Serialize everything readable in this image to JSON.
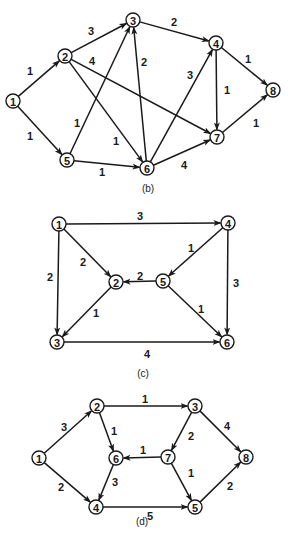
{
  "colors": {
    "ink": "#1a1a1a",
    "background": "#ffffff"
  },
  "node_radius": 7,
  "graphs": [
    {
      "id": "b",
      "caption": "(b)",
      "caption_pos": [
        148,
        188
      ],
      "nodes": [
        {
          "id": "1",
          "x": 13,
          "y": 101
        },
        {
          "id": "2",
          "x": 65,
          "y": 56
        },
        {
          "id": "3",
          "x": 133,
          "y": 20
        },
        {
          "id": "4",
          "x": 216,
          "y": 43
        },
        {
          "id": "5",
          "x": 67,
          "y": 160
        },
        {
          "id": "6",
          "x": 147,
          "y": 168
        },
        {
          "id": "7",
          "x": 217,
          "y": 137
        },
        {
          "id": "8",
          "x": 273,
          "y": 90
        }
      ],
      "edges": [
        {
          "from": "1",
          "to": "2",
          "weight": "1",
          "lx": 30,
          "ly": 71
        },
        {
          "from": "1",
          "to": "5",
          "weight": "1",
          "lx": 30,
          "ly": 136
        },
        {
          "from": "2",
          "to": "3",
          "weight": "3",
          "lx": 91,
          "ly": 31
        },
        {
          "from": "2",
          "to": "7",
          "weight": "4",
          "lx": 92,
          "ly": 61
        },
        {
          "from": "2",
          "to": "6",
          "weight": "1",
          "lx": 116,
          "ly": 141
        },
        {
          "from": "5",
          "to": "3",
          "weight": "1",
          "lx": 77,
          "ly": 123
        },
        {
          "from": "5",
          "to": "6",
          "weight": "1",
          "lx": 102,
          "ly": 172
        },
        {
          "from": "6",
          "to": "3",
          "weight": "2",
          "lx": 144,
          "ly": 62
        },
        {
          "from": "3",
          "to": "4",
          "weight": "2",
          "lx": 174,
          "ly": 22
        },
        {
          "from": "6",
          "to": "4",
          "weight": "3",
          "lx": 190,
          "ly": 75
        },
        {
          "from": "6",
          "to": "7",
          "weight": "4",
          "lx": 184,
          "ly": 165
        },
        {
          "from": "4",
          "to": "7",
          "weight": "1",
          "lx": 227,
          "ly": 90
        },
        {
          "from": "4",
          "to": "8",
          "weight": "1",
          "lx": 248,
          "ly": 59
        },
        {
          "from": "7",
          "to": "8",
          "weight": "1",
          "lx": 256,
          "ly": 123
        }
      ]
    },
    {
      "id": "c",
      "caption": "(c)",
      "caption_pos": [
        143,
        373
      ],
      "nodes": [
        {
          "id": "1",
          "x": 59,
          "y": 224
        },
        {
          "id": "2",
          "x": 116,
          "y": 282
        },
        {
          "id": "3",
          "x": 57,
          "y": 342
        },
        {
          "id": "4",
          "x": 228,
          "y": 223
        },
        {
          "id": "5",
          "x": 163,
          "y": 281
        },
        {
          "id": "6",
          "x": 227,
          "y": 342
        }
      ],
      "edges": [
        {
          "from": "1",
          "to": "4",
          "weight": "3",
          "lx": 140,
          "ly": 216
        },
        {
          "from": "1",
          "to": "2",
          "weight": "2",
          "lx": 83,
          "ly": 262
        },
        {
          "from": "1",
          "to": "3",
          "weight": "2",
          "lx": 50,
          "ly": 277
        },
        {
          "from": "4",
          "to": "5",
          "weight": "1",
          "lx": 191,
          "ly": 248
        },
        {
          "from": "5",
          "to": "2",
          "weight": "2",
          "lx": 140,
          "ly": 276
        },
        {
          "from": "4",
          "to": "6",
          "weight": "3",
          "lx": 236,
          "ly": 283
        },
        {
          "from": "2",
          "to": "3",
          "weight": "1",
          "lx": 96,
          "ly": 313
        },
        {
          "from": "5",
          "to": "6",
          "weight": "1",
          "lx": 201,
          "ly": 309
        },
        {
          "from": "3",
          "to": "6",
          "weight": "4",
          "lx": 147,
          "ly": 354
        }
      ]
    },
    {
      "id": "d",
      "caption": "(d)",
      "caption_pos": [
        142,
        521
      ],
      "nodes": [
        {
          "id": "1",
          "x": 39,
          "y": 458
        },
        {
          "id": "2",
          "x": 97,
          "y": 406
        },
        {
          "id": "3",
          "x": 195,
          "y": 406
        },
        {
          "id": "4",
          "x": 96,
          "y": 507
        },
        {
          "id": "5",
          "x": 195,
          "y": 507
        },
        {
          "id": "6",
          "x": 116,
          "y": 458
        },
        {
          "id": "7",
          "x": 168,
          "y": 457
        },
        {
          "id": "8",
          "x": 246,
          "y": 457
        }
      ],
      "edges": [
        {
          "from": "1",
          "to": "2",
          "weight": "3",
          "lx": 64,
          "ly": 427
        },
        {
          "from": "1",
          "to": "4",
          "weight": "2",
          "lx": 61,
          "ly": 487
        },
        {
          "from": "2",
          "to": "3",
          "weight": "1",
          "lx": 145,
          "ly": 399
        },
        {
          "from": "2",
          "to": "6",
          "weight": "1",
          "lx": 114,
          "ly": 431
        },
        {
          "from": "3",
          "to": "7",
          "weight": "2",
          "lx": 191,
          "ly": 436
        },
        {
          "from": "3",
          "to": "8",
          "weight": "4",
          "lx": 227,
          "ly": 426
        },
        {
          "from": "7",
          "to": "6",
          "weight": "1",
          "lx": 143,
          "ly": 450
        },
        {
          "from": "7",
          "to": "5",
          "weight": "1",
          "lx": 191,
          "ly": 473
        },
        {
          "from": "6",
          "to": "4",
          "weight": "3",
          "lx": 115,
          "ly": 482
        },
        {
          "from": "4",
          "to": "5",
          "weight": "5",
          "lx": 150,
          "ly": 516
        },
        {
          "from": "5",
          "to": "8",
          "weight": "2",
          "lx": 230,
          "ly": 486
        }
      ]
    }
  ]
}
